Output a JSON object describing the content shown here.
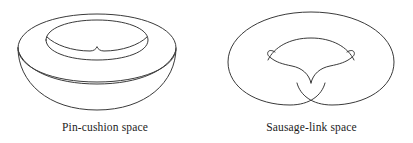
{
  "figure": {
    "background_color": "#ffffff",
    "stroke_color": "#3a3a3a",
    "text_color": "#1c1c1c",
    "panels": [
      {
        "id": "pin-cushion",
        "caption": "Pin-cushion space",
        "shape_description": "torus-like solid of revolution with cusped inner hole"
      },
      {
        "id": "sausage-link",
        "caption": "Sausage-link space",
        "shape_description": "annulus pinched to a point at bottom center forming two lobes"
      }
    ]
  }
}
